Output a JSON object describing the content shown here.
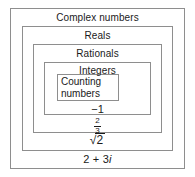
{
  "diagram": {
    "border_color": "#8e8e8e",
    "text_color": "#1a1a1a",
    "background_color": "#ffffff",
    "rings": [
      {
        "key": "complex",
        "label": "Complex numbers",
        "level": 1
      },
      {
        "key": "reals",
        "label": "Reals",
        "level": 2
      },
      {
        "key": "rationals",
        "label": "Rationals",
        "level": 3
      },
      {
        "key": "integers",
        "label": "Integers",
        "level": 4
      },
      {
        "key": "counting",
        "label": "Counting numbers",
        "label_line1": "Counting",
        "label_line2": "numbers",
        "level": 5
      }
    ],
    "examples": [
      {
        "key": "integer_example",
        "text": "−1",
        "belongs_to": "integers"
      },
      {
        "key": "rational_example",
        "numerator": "2",
        "denominator": "3",
        "text": "2/3",
        "belongs_to": "rationals"
      },
      {
        "key": "real_example",
        "radical_symbol": "√",
        "radicand": "2",
        "text": "√2",
        "belongs_to": "reals"
      },
      {
        "key": "complex_example",
        "real_part": "2 + 3",
        "imaginary_unit": "i",
        "text": "2 + 3i",
        "belongs_to": "complex"
      }
    ]
  }
}
